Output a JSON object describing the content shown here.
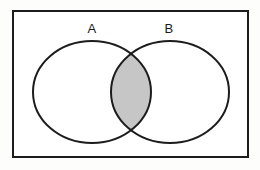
{
  "diagram": {
    "kind": "venn-diagram",
    "universe": {
      "label": "",
      "border_color": "#1c1c1c",
      "fill_color": "#ffffff",
      "border_width": 2,
      "x": 13,
      "y": 11,
      "width": 235,
      "height": 146
    },
    "sets": [
      {
        "id": "A",
        "label": "A",
        "label_x": 92,
        "label_y": 33,
        "center_x": 92,
        "center_y": 92,
        "radius_x": 59,
        "radius_y": 51,
        "stroke_color": "#1c1c1c",
        "fill_color": "#ffffff",
        "stroke_width": 2
      },
      {
        "id": "B",
        "label": "B",
        "label_x": 169,
        "label_y": 33,
        "center_x": 170,
        "center_y": 92,
        "radius_x": 59,
        "radius_y": 51,
        "stroke_color": "#1c1c1c",
        "fill_color": "#ffffff",
        "stroke_width": 2
      }
    ],
    "intersection": {
      "id": "A-and-B",
      "label": "",
      "shaded": true,
      "fill_color": "#c6c6c6",
      "stroke_color": "#1c1c1c",
      "left_x": 111,
      "right_x": 151,
      "top_y": 52,
      "bottom_y": 132
    },
    "background_color": "#fdfdfb"
  }
}
